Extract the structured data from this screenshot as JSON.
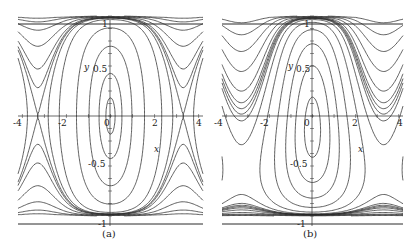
{
  "figure": {
    "panels": [
      {
        "id": "a",
        "caption": "(a)"
      },
      {
        "id": "b",
        "caption": "(b)"
      }
    ]
  },
  "axes": {
    "x_label": "x",
    "y_label": "y",
    "x_ticks": [
      "-4",
      "-2",
      "0",
      "2",
      "4"
    ],
    "y_ticks": {
      "top": "1",
      "mid_pos": "0.5",
      "mid_neg": "-0.5",
      "bottom": "-1"
    }
  },
  "colors": {
    "line": "#2a2a2a",
    "background": "#ffffff"
  },
  "chart_data": [
    {
      "type": "line",
      "title": "(a)",
      "description": "Phase portrait level curves: closed orbits around origin, separatrices with saddle points near x=±3.3, lobes near y=±0.95 at x=±3.3",
      "xlabel": "x",
      "ylabel": "y",
      "xlim": [
        -4.2,
        4.2
      ],
      "ylim": [
        -1,
        1
      ],
      "x_ticks": [
        -4,
        -2,
        0,
        2,
        4
      ],
      "y_ticks": [
        -1,
        -0.5,
        0.5,
        1
      ],
      "grid": false,
      "centers": [
        [
          0,
          0
        ]
      ],
      "saddles": [
        [
          -3.3,
          0
        ],
        [
          3.3,
          0
        ]
      ]
    },
    {
      "type": "line",
      "title": "(b)",
      "description": "Phase portrait level curves: nested closed orbits around origin, saddles at x≈±3.3 with y≈±0.3 crossings, closed lobes near (±3.4, -0.75) and (±3.4, 0.95)",
      "xlabel": "x",
      "ylabel": "y",
      "xlim": [
        -4.2,
        4.2
      ],
      "ylim": [
        -1,
        1
      ],
      "x_ticks": [
        -4,
        -2,
        0,
        2,
        4
      ],
      "y_ticks": [
        -1,
        -0.5,
        0.5,
        1
      ],
      "grid": false,
      "centers": [
        [
          0,
          0
        ],
        [
          -3.4,
          -0.75
        ],
        [
          3.4,
          -0.75
        ]
      ],
      "saddles": [
        [
          -3.3,
          -0.35
        ],
        [
          3.3,
          -0.35
        ]
      ]
    }
  ]
}
